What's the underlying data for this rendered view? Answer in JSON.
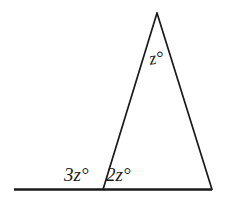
{
  "figure": {
    "background_color": "#ffffff",
    "stroke_color": "#1a1a1a",
    "labels": {
      "apex_angle": "z°",
      "base_exterior_angle": "3z°",
      "base_interior_angle": "2z°"
    },
    "geometry": {
      "apex": [
        157,
        13
      ],
      "base_left_vertex": [
        103,
        190
      ],
      "base_right_vertex": [
        212,
        190
      ],
      "baseline_start": [
        14,
        190
      ],
      "baseline_end": [
        212,
        190
      ]
    }
  }
}
